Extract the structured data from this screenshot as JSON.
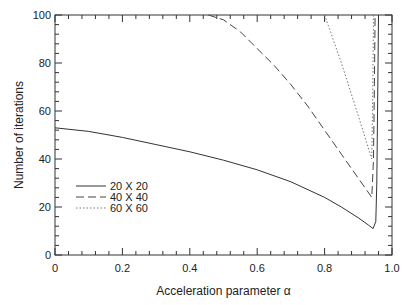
{
  "chart_data": {
    "type": "line",
    "title": "",
    "xlabel": "Acceleration parameter α",
    "ylabel": "Number of iterations",
    "xlim": [
      0,
      1.0
    ],
    "ylim": [
      0,
      100
    ],
    "xticks": [
      "0",
      "0.2",
      "0.4",
      "0.6",
      "0.8",
      "1.0"
    ],
    "yticks": [
      "0",
      "20",
      "40",
      "60",
      "80",
      "100"
    ],
    "grid": false,
    "legend_position": "lower left",
    "series": [
      {
        "name": "20 X 20",
        "style": "solid",
        "x": [
          0,
          0.1,
          0.2,
          0.3,
          0.4,
          0.5,
          0.6,
          0.7,
          0.8,
          0.85,
          0.9,
          0.93,
          0.944,
          0.952,
          0.955,
          0.958,
          0.96
        ],
        "y": [
          53,
          51.5,
          49,
          46,
          43,
          39.5,
          35.5,
          30.5,
          24,
          20,
          15.5,
          12.5,
          11,
          14,
          30,
          70,
          100
        ]
      },
      {
        "name": "40 X 40",
        "style": "dashed",
        "x": [
          0.455,
          0.5,
          0.55,
          0.6,
          0.65,
          0.7,
          0.75,
          0.8,
          0.85,
          0.9,
          0.94,
          0.945,
          0.948,
          0.95
        ],
        "y": [
          100,
          98,
          93,
          86,
          79,
          71,
          62,
          52,
          42,
          32,
          24,
          40,
          75,
          100
        ]
      },
      {
        "name": "60 X 60",
        "style": "dotted",
        "x": [
          0.8,
          0.85,
          0.9,
          0.94,
          0.943,
          0.945
        ],
        "y": [
          100,
          80,
          58,
          40,
          70,
          100
        ]
      }
    ]
  },
  "axes": {
    "xlabel": "Acceleration parameter α",
    "ylabel": "Number of iterations"
  },
  "legend": [
    "20 X 20",
    "40 X 40",
    "60 X 60"
  ]
}
